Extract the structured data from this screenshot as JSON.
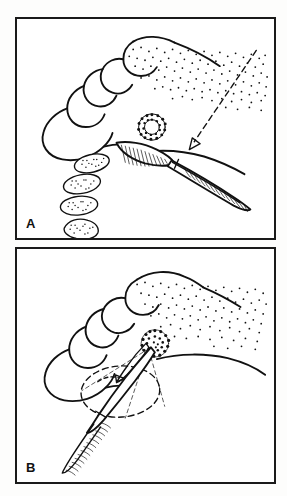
{
  "figure": {
    "type": "line-drawing",
    "background_color": "#fdfdfc",
    "ink_color": "#111111",
    "panel_count": 2
  },
  "panels": [
    {
      "id": "A",
      "label": "A",
      "caption_text": "A",
      "elements": {
        "gingival_margin": "scalloped maxillary gingival margin with four tooth outlines",
        "tooth_count": 4,
        "stipple_field": "attached gingiva stippling along palatal vault",
        "donor_ring": "circular ragged donor-site outline",
        "blade": "hatched scalpel blade engaging tissue",
        "handle": "knurled scalpel handle with serrated grip",
        "graft_strips": "four stippled oval connective-tissue strips",
        "graft_strip_count": 4,
        "pointer": "long dashed arrow directed toward incision line"
      }
    },
    {
      "id": "B",
      "label": "B",
      "caption_text": "B",
      "elements": {
        "gingival_margin": "scalloped maxillary gingival margin with four tooth outlines",
        "tooth_count": 4,
        "stipple_field": "attached gingiva stippling along palatal vault",
        "graft_mass": "stippled tissue mass grasped at instrument tip",
        "instrument": "fine tissue forceps with knurled handle",
        "dashed_outline": "dashed elliptical outline of recipient bed",
        "rotation_arrow": "short curved arrow indicating tissue transfer direction",
        "guide_lines": "thin dashed guide lines from tip to recipient bed"
      }
    }
  ],
  "labels": {
    "panel_a": "A",
    "panel_b": "B"
  }
}
